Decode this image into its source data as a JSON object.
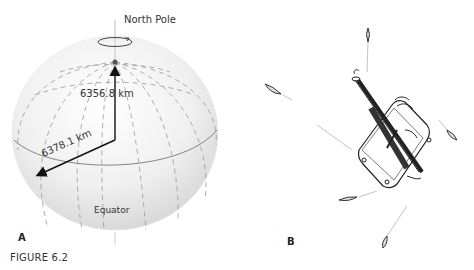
{
  "figure": {
    "caption": "FIGURE 6.2",
    "panel_a": {
      "letter": "A",
      "labels": {
        "north_pole": "North Pole",
        "polar_radius": "6356.8 km",
        "equatorial_radius": "6378.1 km",
        "equator": "Equator"
      }
    },
    "panel_b": {
      "letter": "B"
    }
  }
}
